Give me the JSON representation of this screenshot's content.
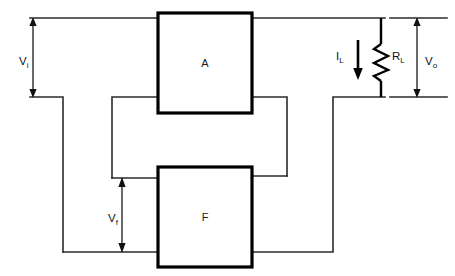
{
  "diagram": {
    "blocks": [
      {
        "id": "amplifier",
        "label": "A",
        "role": "forward-amplifier"
      },
      {
        "id": "feedback",
        "label": "F",
        "role": "feedback-network"
      }
    ],
    "labels": {
      "input_voltage": "V",
      "input_voltage_sub": "i",
      "output_voltage": "V",
      "output_voltage_sub": "o",
      "feedback_voltage": "V",
      "feedback_voltage_sub": "f",
      "load_current": "I",
      "load_current_sub": "L",
      "load_resistor": "R",
      "load_resistor_sub": "L"
    },
    "components": [
      {
        "name": "load-resistor",
        "symbol": "zigzag",
        "label": "R_L"
      },
      {
        "name": "load-current-arrow",
        "symbol": "down-arrow",
        "label": "I_L"
      }
    ],
    "colors": {
      "wire": "#2b2b2b",
      "block_border": "#000000",
      "background": "#ffffff",
      "text": "#111111"
    }
  }
}
